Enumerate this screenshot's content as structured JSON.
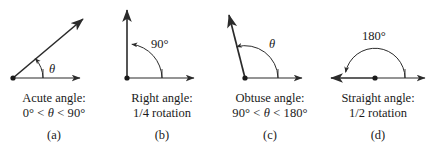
{
  "figure": {
    "stroke_color": "#2b2b2b",
    "text_color": "#1a1a1a",
    "background_color": "#ffffff"
  },
  "panels": [
    {
      "key": "acute",
      "letter": "(a)",
      "caption_line1": "Acute angle:",
      "caption_line2_pre": "0° < ",
      "caption_line2_theta": "θ",
      "caption_line2_post": " < 90°",
      "angle_label": "θ",
      "angle_degrees": 40,
      "description": "acute-angle-diagram"
    },
    {
      "key": "right",
      "letter": "(b)",
      "caption_line1": "Right angle:",
      "caption_line2_pre": "1/4 rotation",
      "caption_line2_theta": "",
      "caption_line2_post": "",
      "angle_label": "90°",
      "angle_degrees": 90,
      "description": "right-angle-diagram"
    },
    {
      "key": "obtuse",
      "letter": "(c)",
      "caption_line1": "Obtuse angle:",
      "caption_line2_pre": "90° < ",
      "caption_line2_theta": "θ",
      "caption_line2_post": " < 180°",
      "angle_label": "θ",
      "angle_degrees": 110,
      "description": "obtuse-angle-diagram"
    },
    {
      "key": "straight",
      "letter": "(d)",
      "caption_line1": "Straight angle:",
      "caption_line2_pre": "1/2 rotation",
      "caption_line2_theta": "",
      "caption_line2_post": "",
      "angle_label": "180°",
      "angle_degrees": 180,
      "description": "straight-angle-diagram"
    }
  ]
}
